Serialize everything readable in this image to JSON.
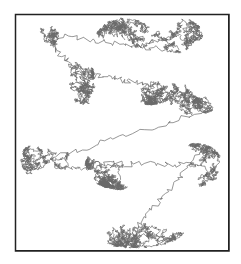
{
  "figure": {
    "type": "random-walk-trajectory",
    "frame": {
      "x": 15,
      "y": 14,
      "width": 214,
      "height": 237,
      "border_color": "#222222"
    },
    "path_color": "#6a6a6a",
    "background": "#ffffff",
    "clusters": [
      {
        "name": "top-center",
        "cx": 125,
        "cy": 40,
        "rx": 30,
        "ry": 22,
        "steps": 900
      },
      {
        "name": "top-right",
        "cx": 175,
        "cy": 35,
        "rx": 28,
        "ry": 18,
        "steps": 700
      },
      {
        "name": "top-left-branch",
        "cx": 50,
        "cy": 35,
        "rx": 18,
        "ry": 8,
        "steps": 250
      },
      {
        "name": "left-strand",
        "cx": 82,
        "cy": 80,
        "rx": 12,
        "ry": 40,
        "steps": 700
      },
      {
        "name": "center-upper",
        "cx": 150,
        "cy": 85,
        "rx": 30,
        "ry": 20,
        "steps": 800
      },
      {
        "name": "right-middle",
        "cx": 195,
        "cy": 95,
        "rx": 28,
        "ry": 20,
        "steps": 700
      },
      {
        "name": "left-middle",
        "cx": 45,
        "cy": 160,
        "rx": 25,
        "ry": 20,
        "steps": 600
      },
      {
        "name": "center-middle",
        "cx": 120,
        "cy": 165,
        "rx": 35,
        "ry": 25,
        "steps": 1100
      },
      {
        "name": "right-lower",
        "cx": 195,
        "cy": 165,
        "rx": 28,
        "ry": 22,
        "steps": 700
      },
      {
        "name": "bottom",
        "cx": 135,
        "cy": 230,
        "rx": 50,
        "ry": 18,
        "steps": 1200
      }
    ]
  }
}
